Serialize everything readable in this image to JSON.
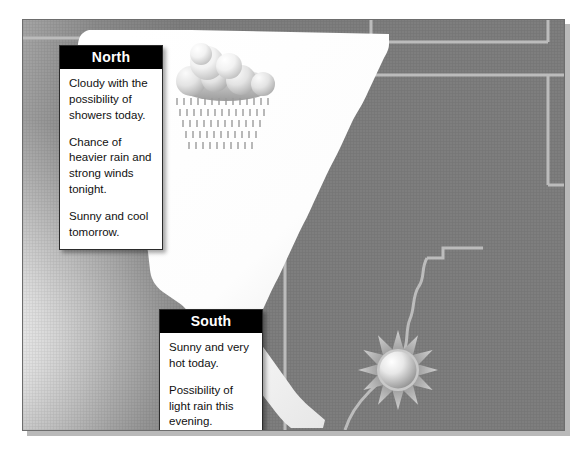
{
  "map": {
    "title": "California regional weather forecast map",
    "region_name": "California",
    "background_color": "#7e7e7e",
    "state_color": "#ffffff",
    "border_color": "#b8b8b8",
    "frame_border_color": "#6d6d6d",
    "ocean_color": "#d9d9d9"
  },
  "callouts": [
    {
      "id": "north",
      "title": "North",
      "title_color": "#ffffff",
      "header_background": "#000000",
      "paragraphs": [
        "Cloudy with the possibility of showers today.",
        "Chance of heavier rain and strong winds tonight.",
        "Sunny and cool tomorrow."
      ]
    },
    {
      "id": "south",
      "title": "South",
      "title_color": "#ffffff",
      "header_background": "#000000",
      "paragraphs": [
        "Sunny and very hot today.",
        "Possibility of light rain this evening.",
        "Warm and partly cloudy tomorrow."
      ]
    }
  ],
  "weather_icons": [
    {
      "id": "rain",
      "name": "cloud-with-rain-icon",
      "region": "north",
      "condition": "Rain showers"
    },
    {
      "id": "sun",
      "name": "sun-icon",
      "region": "south",
      "condition": "Sunny"
    }
  ]
}
